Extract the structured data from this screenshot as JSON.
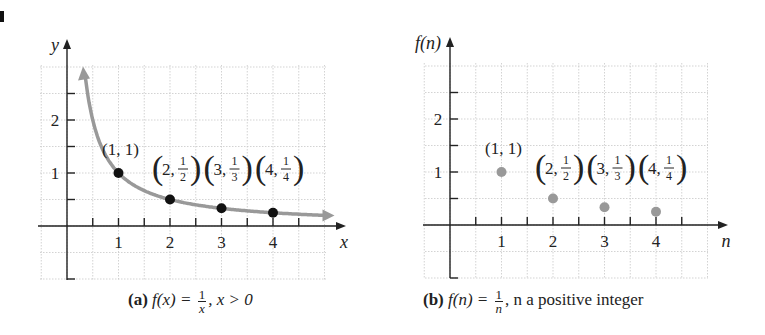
{
  "chart_data": [
    {
      "type": "line",
      "panel": "a",
      "caption": {
        "label": "(a)",
        "function": "f(x) =",
        "numerator": "1",
        "denominator": "x",
        "condition": ", x > 0"
      },
      "xlabel": "x",
      "ylabel": "y",
      "xticks": [
        "1",
        "2",
        "3",
        "4"
      ],
      "yticks": [
        "1",
        "2"
      ],
      "xlim": [
        -0.5,
        5.2
      ],
      "ylim": [
        -1,
        3
      ],
      "grid": true,
      "curve": {
        "formula": "1/x",
        "x_start": 0.35,
        "x_end": 5.0,
        "color": "#999999",
        "arrows": "both"
      },
      "points": [
        {
          "x": 1,
          "y": 1,
          "label": "(1, 1)"
        },
        {
          "x": 2,
          "y": 0.5,
          "label": "(2, 1/2)"
        },
        {
          "x": 3,
          "y": 0.3333,
          "label": "(3, 1/3)"
        },
        {
          "x": 4,
          "y": 0.25,
          "label": "(4, 1/4)"
        }
      ],
      "point_color": "#111111"
    },
    {
      "type": "scatter",
      "panel": "b",
      "caption": {
        "label": "(b)",
        "function": "f(n) =",
        "numerator": "1",
        "denominator": "n",
        "condition": ", n a positive integer"
      },
      "xlabel": "n",
      "ylabel": "f(n)",
      "xticks": [
        "1",
        "2",
        "3",
        "4"
      ],
      "yticks": [
        "1",
        "2"
      ],
      "xlim": [
        -0.5,
        5.2
      ],
      "ylim": [
        -1,
        3
      ],
      "grid": true,
      "points": [
        {
          "x": 1,
          "y": 1,
          "label": "(1, 1)"
        },
        {
          "x": 2,
          "y": 0.5,
          "label": "(2, 1/2)"
        },
        {
          "x": 3,
          "y": 0.3333,
          "label": "(3, 1/3)"
        },
        {
          "x": 4,
          "y": 0.25,
          "label": "(4, 1/4)"
        }
      ],
      "point_color": "#999999"
    }
  ]
}
